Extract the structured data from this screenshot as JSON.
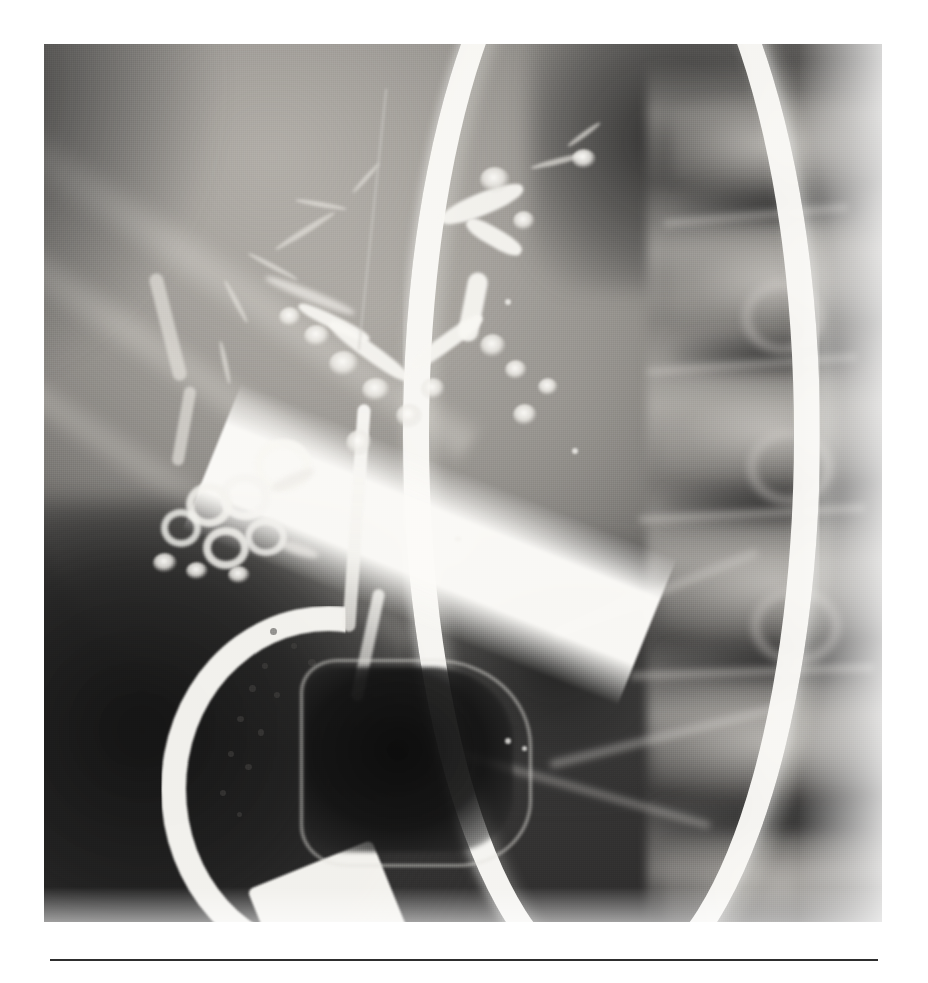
{
  "figure": {
    "kind": "radiograph",
    "modality": "ERCP cholangiogram (fluoroscopic spot radiograph)",
    "orientation": "portrait",
    "caption_rule_color": "#2e2e2e",
    "plate": {
      "background_tone": "#7b7b7b",
      "highlight_tone": "#faf9f6",
      "shadow_tone": "#141414",
      "midtone": "#9a9792"
    },
    "alt_text": "Black and white fluoroscopic ERCP image showing a contrast-opacified intrahepatic and extrahepatic biliary tree with irregular beaded ducts, a long common bile duct, a looping cystic duct cluster, and a bright curving duodenoscope crossing the field with its tip in the duodenum beside a dark gas-filled cavity; lumbar vertebrae are visible at the right."
  },
  "structures": [
    {
      "id": "intrahepatic-ducts",
      "label": "Intrahepatic bile ducts",
      "note": "irregular, beaded, contrast filled"
    },
    {
      "id": "hilar-confluence",
      "label": "Hilar confluence",
      "note": "V-shaped junction of right and left hepatic ducts"
    },
    {
      "id": "right-hepatic-duct",
      "label": "Right hepatic duct",
      "note": "upper right branch with nodular filling"
    },
    {
      "id": "left-hepatic-duct",
      "label": "Left hepatic duct",
      "note": "upper left branch, thin and attenuated"
    },
    {
      "id": "common-bile-duct",
      "label": "Common bile duct",
      "note": "long vertical opacified stem"
    },
    {
      "id": "cystic-duct-loops",
      "label": "Cystic duct / spiral valve loops",
      "note": "cluster of curled opacified loops, left mid field"
    },
    {
      "id": "duodenoscope",
      "label": "Side-viewing duodenoscope",
      "note": "bright white curving shaft entering from top right"
    },
    {
      "id": "scope-bending-section",
      "label": "Scope bending section and tip",
      "note": "speckled distal segment curving to lower left"
    },
    {
      "id": "duodenal-gas-cavity",
      "label": "Gas-filled duodenal lumen",
      "note": "dark quadrilateral cavity adjacent to scope tip"
    },
    {
      "id": "lumbar-spine",
      "label": "Lumbar vertebral bodies",
      "note": "right side of field"
    },
    {
      "id": "rib-shadows",
      "label": "Rib shadows",
      "note": "diagonal bands across upper left"
    },
    {
      "id": "bowel-gas",
      "label": "Bowel gas",
      "note": "dark lucencies lower left and lower right"
    }
  ]
}
